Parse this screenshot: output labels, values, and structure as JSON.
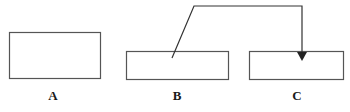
{
  "figure": {
    "background_color": "#ffffff",
    "stroke_color": "#555555",
    "arrow_color": "#333333",
    "label_color": "#1a1a1a",
    "width": 350,
    "height": 112
  },
  "shapes": {
    "rect_a": {
      "name": "A",
      "x": 9,
      "y": 32,
      "width": 91,
      "height": 46,
      "fill": "#ffffff",
      "stroke": "#555555",
      "stroke_width": 1
    },
    "rect_b": {
      "name": "B",
      "x": 126,
      "y": 51,
      "width": 102,
      "height": 28,
      "fill": "#ffffff",
      "stroke": "#555555",
      "stroke_width": 1
    },
    "rect_c": {
      "name": "C",
      "x": 249,
      "y": 51,
      "width": 94,
      "height": 28,
      "fill": "#ffffff",
      "stroke": "#555555",
      "stroke_width": 1
    }
  },
  "connector": {
    "name": "arrow-b-to-c",
    "points": "172,58 194,6 302,6 302,53",
    "stroke": "#333333",
    "stroke_width": 1.2,
    "arrowhead": {
      "points": "297,52 307,52 302,61",
      "fill": "#222222",
      "tip_x": 302,
      "tip_y": 61
    }
  },
  "labels": {
    "a": "A",
    "b": "B",
    "c": "C"
  }
}
